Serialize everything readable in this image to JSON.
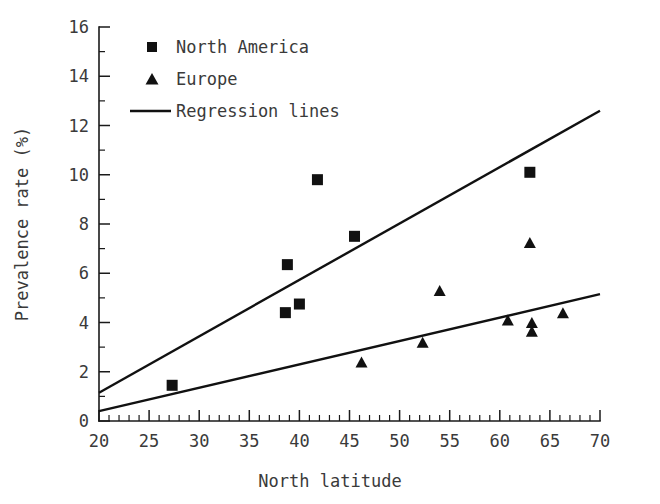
{
  "chart_data": {
    "type": "scatter",
    "title": "",
    "xlabel": "North latitude",
    "ylabel": "Prevalence rate (%)",
    "xlim": [
      20,
      70
    ],
    "ylim": [
      0,
      16
    ],
    "x_ticks": [
      20,
      25,
      30,
      35,
      40,
      45,
      50,
      55,
      60,
      65,
      70
    ],
    "y_ticks": [
      0,
      2,
      4,
      6,
      8,
      10,
      12,
      14,
      16
    ],
    "x_minor_step": 1,
    "y_minor_step": 1,
    "grid": false,
    "legend_position": "top-left",
    "series": [
      {
        "name": "North America",
        "marker": "square",
        "color": "#111111",
        "points": [
          {
            "x": 27.3,
            "y": 1.45
          },
          {
            "x": 38.6,
            "y": 4.4
          },
          {
            "x": 38.8,
            "y": 6.35
          },
          {
            "x": 40.0,
            "y": 4.75
          },
          {
            "x": 41.8,
            "y": 9.8
          },
          {
            "x": 45.5,
            "y": 7.5
          },
          {
            "x": 63.0,
            "y": 10.1
          }
        ]
      },
      {
        "name": "Europe",
        "marker": "triangle",
        "color": "#111111",
        "points": [
          {
            "x": 46.2,
            "y": 2.4
          },
          {
            "x": 52.3,
            "y": 3.2
          },
          {
            "x": 54.0,
            "y": 5.3
          },
          {
            "x": 60.8,
            "y": 4.1
          },
          {
            "x": 63.0,
            "y": 7.25
          },
          {
            "x": 63.2,
            "y": 4.0
          },
          {
            "x": 63.2,
            "y": 3.65
          },
          {
            "x": 66.3,
            "y": 4.4
          }
        ]
      }
    ],
    "regression_lines": [
      {
        "name": "North America regression",
        "x0": 20,
        "y0": 1.15,
        "x1": 70,
        "y1": 12.6
      },
      {
        "name": "Europe regression",
        "x0": 20,
        "y0": 0.4,
        "x1": 70,
        "y1": 5.15
      }
    ]
  },
  "legend": {
    "items": [
      {
        "label": "North America",
        "marker": "square"
      },
      {
        "label": "Europe",
        "marker": "triangle"
      },
      {
        "label": "Regression lines",
        "marker": "line"
      }
    ]
  },
  "axes": {
    "x_title": "North latitude",
    "y_title": "Prevalence rate (%)",
    "x_tick_labels": [
      "20",
      "25",
      "30",
      "35",
      "40",
      "45",
      "50",
      "55",
      "60",
      "65",
      "70"
    ],
    "y_tick_labels": [
      "0",
      "2",
      "4",
      "6",
      "8",
      "10",
      "12",
      "14",
      "16"
    ]
  },
  "colors": {
    "marker": "#111111",
    "line": "#111111",
    "axis": "#1a1a1a",
    "text": "#3a3a3a",
    "background": "#ffffff"
  }
}
